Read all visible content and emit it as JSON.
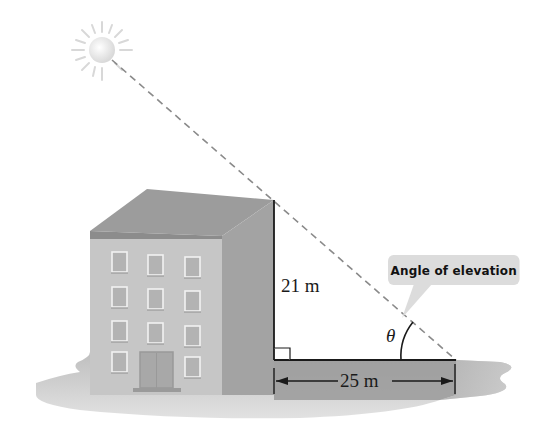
{
  "figure": {
    "callout_label": "Angle of elevation",
    "height_label": "21 m",
    "distance_label": "25 m",
    "angle_symbol": "θ"
  },
  "geometry": {
    "building_height_m": 21,
    "horizontal_distance_m": 25,
    "right_angle_at": "base of building",
    "angle_vertex": "end of horizontal distance"
  },
  "elements": {
    "sun": "sun-icon",
    "building": "building-illustration",
    "line_of_sight": "dashed line from sun to ground point",
    "ground_shadow": "gray ground shadow"
  },
  "colors": {
    "line": "#1a1a1a",
    "dash": "#8a8a8a",
    "building_front": "#c8c8c8",
    "building_side": "#a6a6a6",
    "roof": "#9e9e9e",
    "shadow": "#b5b5b5",
    "callout_bg": "#dcdcdc"
  }
}
